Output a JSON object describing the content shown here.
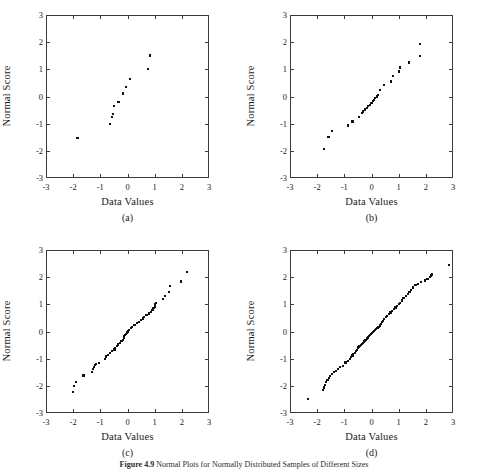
{
  "figure": {
    "caption_label": "Figure 4.9",
    "caption_text": "Normal Plots for Normally Distributed Samples of Different Sizes"
  },
  "axis": {
    "x_title": "Data Values",
    "y_title": "Normal Score",
    "ticks": [
      "-3",
      "-2",
      "-1",
      "0",
      "1",
      "2",
      "3"
    ],
    "tick_values": [
      -3,
      -2,
      -1,
      0,
      1,
      2,
      3
    ],
    "xlim": [
      -3,
      3
    ],
    "ylim": [
      -3,
      3
    ]
  },
  "panels": [
    {
      "tag": "(a)",
      "name": "panel-a"
    },
    {
      "tag": "(b)",
      "name": "panel-b"
    },
    {
      "tag": "(c)",
      "name": "panel-c"
    },
    {
      "tag": "(d)",
      "name": "panel-d"
    }
  ],
  "chart_data": [
    {
      "type": "scatter",
      "title": "(a)",
      "xlabel": "Data Values",
      "ylabel": "Normal Score",
      "xlim": [
        -3,
        3
      ],
      "ylim": [
        -3,
        3
      ],
      "grid": false,
      "legend": null,
      "n": 11,
      "x": [
        -1.84,
        -0.64,
        -0.57,
        -0.54,
        -0.5,
        -0.33,
        -0.16,
        -0.05,
        0.1,
        0.76,
        0.84
      ],
      "y": [
        -1.54,
        -1.0,
        -0.74,
        -0.65,
        -0.36,
        -0.21,
        0.11,
        0.36,
        0.65,
        1.0,
        1.51
      ]
    },
    {
      "type": "scatter",
      "title": "(b)",
      "xlabel": "Data Values",
      "ylabel": "Normal Score",
      "xlim": [
        -3,
        3
      ],
      "ylim": [
        -3,
        3
      ],
      "grid": false,
      "legend": null,
      "n": 25,
      "x": [
        -1.74,
        -1.58,
        -1.45,
        -0.87,
        -0.7,
        -0.45,
        -0.36,
        -0.3,
        -0.23,
        -0.17,
        -0.12,
        -0.06,
        0.0,
        0.05,
        0.1,
        0.14,
        0.19,
        0.24,
        0.31,
        0.46,
        0.71,
        0.78,
        1.0,
        1.05,
        1.38,
        1.78,
        1.8
      ],
      "y": [
        -1.94,
        -1.5,
        -1.28,
        -1.07,
        -0.92,
        -0.76,
        -0.62,
        -0.55,
        -0.48,
        -0.42,
        -0.36,
        -0.3,
        -0.24,
        -0.18,
        -0.12,
        -0.06,
        0.0,
        0.06,
        0.24,
        0.42,
        0.55,
        0.76,
        0.92,
        1.07,
        1.25,
        1.5,
        1.92
      ]
    },
    {
      "type": "scatter",
      "title": "(c)",
      "xlabel": "Data Values",
      "ylabel": "Normal Score",
      "xlim": [
        -3,
        3
      ],
      "ylim": [
        -3,
        3
      ],
      "grid": false,
      "legend": null,
      "n": 50,
      "x": [
        -2.02,
        -1.96,
        -1.9,
        -1.62,
        -1.3,
        -1.26,
        -1.22,
        -1.2,
        -1.16,
        -1.06,
        -0.82,
        -0.78,
        -0.72,
        -0.64,
        -0.56,
        -0.48,
        -0.46,
        -0.4,
        -0.34,
        -0.28,
        -0.22,
        -0.18,
        -0.14,
        -0.12,
        -0.1,
        -0.06,
        -0.02,
        0.02,
        0.06,
        0.12,
        0.18,
        0.26,
        0.34,
        0.42,
        0.5,
        0.56,
        0.62,
        0.7,
        0.78,
        0.86,
        0.92,
        0.96,
        1.0,
        1.02,
        1.06,
        1.32,
        1.38,
        1.52,
        1.56,
        1.98,
        2.2
      ],
      "y": [
        -2.22,
        -2.02,
        -1.86,
        -1.62,
        -1.48,
        -1.38,
        -1.3,
        -1.24,
        -1.2,
        -1.16,
        -1.0,
        -0.92,
        -0.86,
        -0.78,
        -0.72,
        -0.66,
        -0.6,
        -0.54,
        -0.48,
        -0.42,
        -0.36,
        -0.3,
        -0.24,
        -0.18,
        -0.12,
        -0.08,
        -0.04,
        0.0,
        0.06,
        0.12,
        0.18,
        0.24,
        0.3,
        0.36,
        0.42,
        0.48,
        0.54,
        0.6,
        0.66,
        0.72,
        0.8,
        0.86,
        0.92,
        1.0,
        1.06,
        1.2,
        1.3,
        1.44,
        1.66,
        1.84,
        2.2
      ]
    },
    {
      "type": "scatter",
      "title": "(d)",
      "xlabel": "Data Values",
      "ylabel": "Normal Score",
      "xlim": [
        -3,
        3
      ],
      "ylim": [
        -3,
        3
      ],
      "grid": false,
      "legend": null,
      "n": 75,
      "x": [
        -2.34,
        -1.78,
        -1.74,
        -1.7,
        -1.66,
        -1.62,
        -1.56,
        -1.52,
        -1.44,
        -1.38,
        -1.3,
        -1.24,
        -1.16,
        -1.06,
        -0.96,
        -0.86,
        -0.8,
        -0.74,
        -0.7,
        -0.68,
        -0.62,
        -0.58,
        -0.54,
        -0.5,
        -0.48,
        -0.44,
        -0.4,
        -0.36,
        -0.32,
        -0.28,
        -0.26,
        -0.22,
        -0.18,
        -0.14,
        -0.1,
        -0.06,
        -0.02,
        0.02,
        0.06,
        0.1,
        0.14,
        0.18,
        0.22,
        0.26,
        0.3,
        0.34,
        0.38,
        0.42,
        0.46,
        0.52,
        0.58,
        0.64,
        0.7,
        0.76,
        0.82,
        0.88,
        0.94,
        1.0,
        1.06,
        1.12,
        1.18,
        1.26,
        1.34,
        1.4,
        1.46,
        1.52,
        1.62,
        1.72,
        1.82,
        1.96,
        2.06,
        2.16,
        2.2,
        2.24,
        2.84
      ],
      "y": [
        -2.48,
        -2.16,
        -2.06,
        -1.96,
        -1.86,
        -1.78,
        -1.7,
        -1.64,
        -1.56,
        -1.5,
        -1.44,
        -1.38,
        -1.32,
        -1.26,
        -1.14,
        -1.08,
        -1.0,
        -0.94,
        -0.88,
        -0.82,
        -0.78,
        -0.72,
        -0.68,
        -0.62,
        -0.58,
        -0.54,
        -0.5,
        -0.46,
        -0.42,
        -0.38,
        -0.34,
        -0.3,
        -0.26,
        -0.22,
        -0.18,
        -0.14,
        -0.1,
        -0.06,
        -0.02,
        0.02,
        0.06,
        0.1,
        0.14,
        0.18,
        0.22,
        0.28,
        0.34,
        0.4,
        0.46,
        0.52,
        0.58,
        0.64,
        0.7,
        0.76,
        0.82,
        0.88,
        0.94,
        1.0,
        1.06,
        1.14,
        1.22,
        1.3,
        1.38,
        1.46,
        1.54,
        1.62,
        1.7,
        1.76,
        1.82,
        1.88,
        1.94,
        2.0,
        2.06,
        2.1,
        2.44
      ]
    }
  ]
}
